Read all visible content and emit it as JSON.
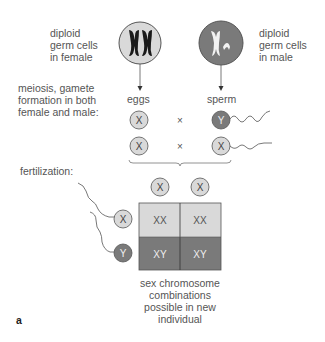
{
  "labels": {
    "female_cells": [
      "diploid",
      "germ cells",
      "in female"
    ],
    "male_cells": [
      "diploid",
      "germ cells",
      "in male"
    ],
    "meiosis": [
      "meiosis, gamete",
      "formation in both",
      "female and male:"
    ],
    "eggs": "eggs",
    "sperm": "sperm",
    "fertilization": "fertilization:",
    "caption": [
      "sex chromosome",
      "combinations",
      "possible in new",
      "individual"
    ],
    "panel": "a"
  },
  "gametes": {
    "egg_rows": [
      "X",
      "X"
    ],
    "cross_symbol": "×",
    "sperm_rows": [
      "Y",
      "X"
    ]
  },
  "punnett": {
    "top": [
      "X",
      "X"
    ],
    "side": [
      "X",
      "Y"
    ],
    "cells": [
      [
        "XX",
        "XX"
      ],
      [
        "XY",
        "XY"
      ]
    ]
  },
  "colors": {
    "light_gray": "#d9d9d9",
    "dark_gray": "#7a7a7a",
    "line": "#555555",
    "text": "#555555"
  }
}
